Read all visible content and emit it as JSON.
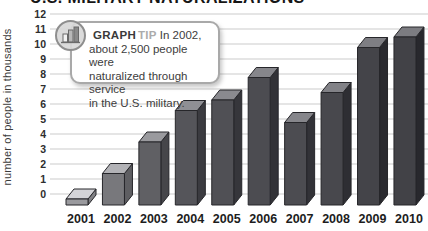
{
  "title": "U.S. MILITARY NATURALIZATIONS",
  "y_axis": {
    "title": "number of people in thousands"
  },
  "graph_tip": {
    "icon": "bar-chart-icon",
    "label": "GRAPH",
    "label2": "TIP",
    "lines": [
      "In 2002,",
      "about 2,500 people were",
      "naturalized through service",
      "in the U.S. military."
    ]
  },
  "chart_data": {
    "type": "bar",
    "title": "U.S. MILITARY NATURALIZATIONS",
    "categories": [
      "2001",
      "2002",
      "2003",
      "2004",
      "2005",
      "2006",
      "2007",
      "2008",
      "2009",
      "2010"
    ],
    "values": [
      0.4,
      2.1,
      4.2,
      6.3,
      7.0,
      8.5,
      5.5,
      7.5,
      10.5,
      11.2
    ],
    "values_unit": "thousands of people",
    "ylabel": "number of people in thousands",
    "xlabel": "",
    "ylim": [
      0,
      12
    ],
    "ytick_step": 1,
    "grid": true,
    "legend": "none",
    "style_3d": true,
    "gridline_color": "#cbcbcb",
    "bar_stroke_color": "#26262a",
    "bar_front_colors": [
      "#9a9a9e",
      "#78787c",
      "#606064",
      "#55555a",
      "#505055",
      "#4c4c51",
      "#4c4c51",
      "#48484d",
      "#444449",
      "#424247"
    ],
    "annotation": "In 2002, about 2,500 people were naturalized through service in the U.S. military."
  }
}
